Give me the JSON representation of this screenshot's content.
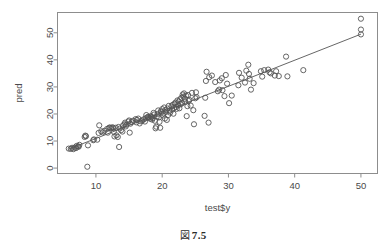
{
  "figure": {
    "caption_marker": "図",
    "caption_number": "7.5",
    "top_trace": "",
    "background_color": "#ffffff",
    "frame_color": "#8d8d8d",
    "point_color": "#555555",
    "line_color": "#555555"
  },
  "chart_data": {
    "type": "scatter",
    "title": "",
    "subtitle": "",
    "xlabel": "test$y",
    "ylabel": "pred",
    "xlim": [
      4.2,
      52.5
    ],
    "ylim": [
      -2.0,
      57.5
    ],
    "xticks": [
      10,
      20,
      30,
      40,
      50
    ],
    "xtick_labels": [
      "10",
      "20",
      "30",
      "40",
      "50"
    ],
    "yticks": [
      0,
      10,
      20,
      30,
      40,
      50
    ],
    "ytick_labels": [
      "0",
      "10",
      "20",
      "30",
      "40",
      "50"
    ],
    "grid": false,
    "legend": null,
    "marker": "open-circle",
    "marker_size": 2.6,
    "annotations": [],
    "series": [
      {
        "name": "pred vs test$y",
        "type": "scatter",
        "x": [
          5.9,
          6.2,
          6.4,
          6.6,
          6.8,
          7.0,
          7.1,
          7.3,
          7.4,
          7.5,
          8.3,
          8.4,
          8.5,
          8.7,
          8.8,
          9.6,
          9.7,
          10.2,
          10.4,
          10.5,
          10.8,
          11.0,
          11.3,
          11.7,
          11.8,
          12.0,
          12.1,
          12.3,
          12.5,
          12.6,
          12.7,
          12.8,
          13.0,
          13.1,
          13.3,
          13.4,
          13.5,
          13.6,
          13.8,
          14.0,
          14.1,
          14.3,
          14.4,
          14.5,
          14.6,
          14.9,
          15.0,
          15.1,
          15.2,
          15.4,
          15.6,
          16.0,
          16.1,
          16.2,
          16.4,
          16.6,
          16.8,
          17.0,
          17.2,
          17.4,
          17.5,
          17.6,
          17.8,
          17.9,
          18.0,
          18.2,
          18.3,
          18.4,
          18.5,
          18.6,
          18.7,
          18.8,
          18.9,
          19.0,
          19.1,
          19.2,
          19.3,
          19.4,
          19.5,
          19.6,
          19.7,
          19.8,
          19.9,
          20.0,
          20.1,
          20.2,
          20.3,
          20.4,
          20.5,
          20.6,
          20.7,
          20.8,
          20.9,
          21.0,
          21.1,
          21.2,
          21.4,
          21.5,
          21.6,
          21.7,
          21.8,
          21.9,
          22.0,
          22.1,
          22.2,
          22.3,
          22.4,
          22.5,
          22.6,
          22.7,
          22.8,
          22.9,
          23.0,
          23.1,
          23.2,
          23.3,
          23.4,
          23.5,
          23.6,
          23.7,
          23.8,
          23.9,
          24.0,
          24.1,
          24.3,
          24.5,
          24.7,
          24.8,
          25.0,
          25.1,
          25.2,
          26.4,
          26.5,
          26.6,
          26.7,
          27.0,
          27.1,
          27.5,
          28.0,
          28.4,
          28.6,
          28.7,
          29.0,
          29.1,
          29.4,
          29.6,
          29.8,
          30.1,
          30.5,
          31.5,
          31.6,
          32.0,
          32.5,
          32.7,
          33.0,
          33.1,
          33.2,
          33.4,
          33.8,
          34.9,
          35.1,
          35.4,
          36.0,
          36.2,
          36.4,
          37.0,
          37.2,
          37.6,
          38.7,
          38.9,
          41.3,
          50.0,
          50.0,
          50.0
        ],
        "y": [
          7.2,
          7.1,
          7.5,
          7.0,
          7.6,
          7.4,
          8.2,
          8.0,
          7.9,
          8.6,
          11.5,
          12.0,
          11.8,
          0.5,
          8.4,
          10.3,
          10.6,
          10.5,
          13.0,
          15.8,
          13.6,
          13.2,
          13.8,
          14.5,
          13.1,
          14.9,
          15.0,
          14.7,
          15.1,
          14.8,
          13.4,
          11.7,
          14.9,
          12.1,
          11.5,
          15.2,
          7.8,
          14.6,
          14.0,
          13.5,
          15.8,
          16.2,
          16.8,
          15.4,
          16.0,
          17.2,
          17.6,
          13.1,
          16.4,
          17.0,
          17.5,
          18.1,
          16.9,
          17.8,
          18.3,
          16.5,
          17.3,
          17.6,
          18.0,
          17.2,
          18.4,
          19.6,
          18.8,
          19.0,
          18.6,
          18.2,
          19.2,
          18.9,
          17.9,
          18.5,
          20.4,
          19.8,
          17.5,
          14.7,
          15.3,
          19.1,
          20.0,
          21.3,
          18.7,
          17.1,
          14.9,
          21.0,
          20.6,
          21.8,
          19.4,
          20.2,
          22.4,
          18.3,
          21.5,
          20.8,
          17.8,
          22.0,
          19.6,
          23.0,
          21.2,
          20.5,
          22.8,
          21.6,
          23.4,
          20.1,
          22.2,
          23.8,
          24.2,
          22.6,
          21.9,
          25.0,
          23.2,
          24.6,
          22.1,
          25.4,
          23.6,
          26.0,
          24.0,
          27.2,
          26.4,
          27.6,
          25.6,
          24.4,
          26.8,
          19.2,
          22.9,
          27.0,
          24.8,
          25.2,
          23.1,
          27.8,
          21.4,
          16.2,
          25.8,
          28.0,
          26.2,
          19.3,
          26.0,
          32.2,
          35.6,
          16.8,
          33.6,
          34.2,
          31.8,
          28.4,
          29.0,
          32.4,
          33.2,
          28.8,
          26.6,
          34.4,
          31.2,
          24.0,
          26.8,
          30.6,
          35.2,
          33.4,
          31.6,
          36.0,
          38.2,
          34.8,
          33.0,
          29.0,
          31.4,
          35.8,
          33.8,
          36.2,
          36.4,
          35.4,
          35.0,
          34.2,
          35.8,
          34.0,
          41.2,
          33.9,
          36.2,
          55.2,
          51.2,
          49.4
        ]
      }
    ],
    "fit_line": {
      "name": "regression-line",
      "type": "line",
      "x": [
        5.9,
        50.0
      ],
      "y": [
        7.0,
        49.5
      ]
    }
  }
}
